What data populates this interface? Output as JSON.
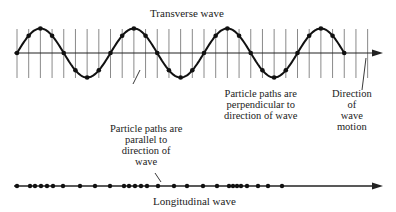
{
  "diagram": {
    "transverse": {
      "title": "Transverse wave",
      "particle_label": [
        "Particle paths are",
        "perpendicular to",
        "direction of wave"
      ],
      "direction_label": [
        "Direction",
        "of",
        "wave",
        "motion"
      ]
    },
    "longitudinal": {
      "title": "Longitudinal wave",
      "particle_label": [
        "Particle paths are",
        "parallel to",
        "direction of",
        "wave"
      ]
    },
    "colors": {
      "ink": "#222222",
      "grid": "#888888",
      "background": "#ffffff"
    }
  }
}
